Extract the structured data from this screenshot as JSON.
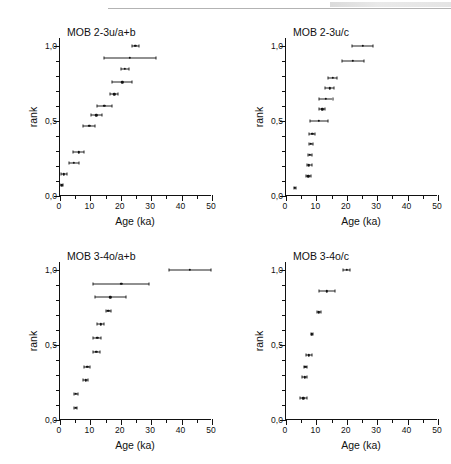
{
  "figure": {
    "axis_x_title": "Age (ka)",
    "axis_y_title": "rank",
    "x_ticks_major": [
      "0",
      "10",
      "20",
      "30",
      "40",
      "50"
    ],
    "y_ticks_major": [
      "0,0",
      "0,5",
      "1,0"
    ]
  },
  "chart_data": [
    {
      "type": "scatter",
      "title": "MOB 2-3u/a+b",
      "xlabel": "Age (ka)",
      "ylabel": "rank",
      "xlim": [
        0,
        50
      ],
      "ylim": [
        0,
        1.05
      ],
      "xticks": [
        0,
        10,
        20,
        30,
        40,
        50
      ],
      "yticks": [
        0.0,
        0.5,
        1.0
      ],
      "grid": false,
      "legend": "none",
      "x": [
        0.6,
        1.3,
        4.6,
        6.2,
        9.6,
        12.0,
        14.6,
        17.8,
        20.5,
        21.4,
        23.0,
        24.8
      ],
      "y": [
        0.072,
        0.145,
        0.22,
        0.29,
        0.465,
        0.535,
        0.6,
        0.675,
        0.755,
        0.845,
        0.92,
        1.0
      ],
      "xerr": [
        0.5,
        0.9,
        1.6,
        1.8,
        1.9,
        1.7,
        2.4,
        1.3,
        3.3,
        1.4,
        8.6,
        1.1
      ]
    },
    {
      "type": "scatter",
      "title": "MOB 2-3u/c",
      "xlabel": "Age (ka)",
      "ylabel": "rank",
      "xlim": [
        0,
        50
      ],
      "ylim": [
        0,
        1.05
      ],
      "xticks": [
        0,
        10,
        20,
        30,
        40,
        50
      ],
      "yticks": [
        0.0,
        0.5,
        1.0
      ],
      "grid": false,
      "legend": "none",
      "x": [
        2.9,
        7.4,
        7.6,
        7.9,
        8.2,
        8.6,
        10.8,
        11.9,
        13.0,
        14.4,
        15.3,
        21.9,
        25.2
      ],
      "y": [
        0.055,
        0.13,
        0.205,
        0.275,
        0.345,
        0.415,
        0.5,
        0.575,
        0.645,
        0.715,
        0.785,
        0.9,
        1.0
      ],
      "xerr": [
        0.4,
        0.8,
        0.8,
        0.7,
        0.7,
        0.9,
        3.0,
        0.9,
        2.3,
        1.5,
        1.6,
        3.6,
        3.4
      ]
    },
    {
      "type": "scatter",
      "title": "MOB 3-4o/a+b",
      "xlabel": "Age (ka)",
      "ylabel": "rank",
      "xlim": [
        0,
        50
      ],
      "ylim": [
        0,
        1.05
      ],
      "xticks": [
        0,
        10,
        20,
        30,
        40,
        50
      ],
      "yticks": [
        0.0,
        0.5,
        1.0
      ],
      "grid": false,
      "legend": "none",
      "x": [
        5.1,
        5.2,
        8.4,
        9.0,
        12.0,
        12.3,
        13.4,
        15.9,
        16.6,
        20.2,
        42.7
      ],
      "y": [
        0.082,
        0.175,
        0.265,
        0.355,
        0.455,
        0.545,
        0.635,
        0.725,
        0.815,
        0.905,
        1.0
      ],
      "xerr": [
        0.6,
        0.6,
        0.9,
        1.0,
        1.0,
        1.3,
        1.1,
        0.8,
        5.2,
        9.2,
        7.0
      ]
    },
    {
      "type": "scatter",
      "title": "MOB 3-4o/c",
      "xlabel": "Age (ka)",
      "ylabel": "rank",
      "xlim": [
        0,
        50
      ],
      "ylim": [
        0,
        1.05
      ],
      "xticks": [
        0,
        10,
        20,
        30,
        40,
        50
      ],
      "yticks": [
        0.0,
        0.5,
        1.0
      ],
      "grid": false,
      "legend": "none",
      "x": [
        5.7,
        6.1,
        6.4,
        7.6,
        8.5,
        10.8,
        13.5,
        20.0
      ],
      "y": [
        0.145,
        0.285,
        0.355,
        0.43,
        0.57,
        0.715,
        0.855,
        1.0
      ],
      "xerr": [
        1.1,
        0.9,
        0.4,
        0.9,
        0.3,
        0.7,
        2.5,
        1.1
      ]
    }
  ],
  "panels": [
    {
      "name": "panel-mob-2-3u-ab"
    },
    {
      "name": "panel-mob-2-3u-c"
    },
    {
      "name": "panel-mob-3-4o-ab"
    },
    {
      "name": "panel-mob-3-4o-c"
    }
  ]
}
